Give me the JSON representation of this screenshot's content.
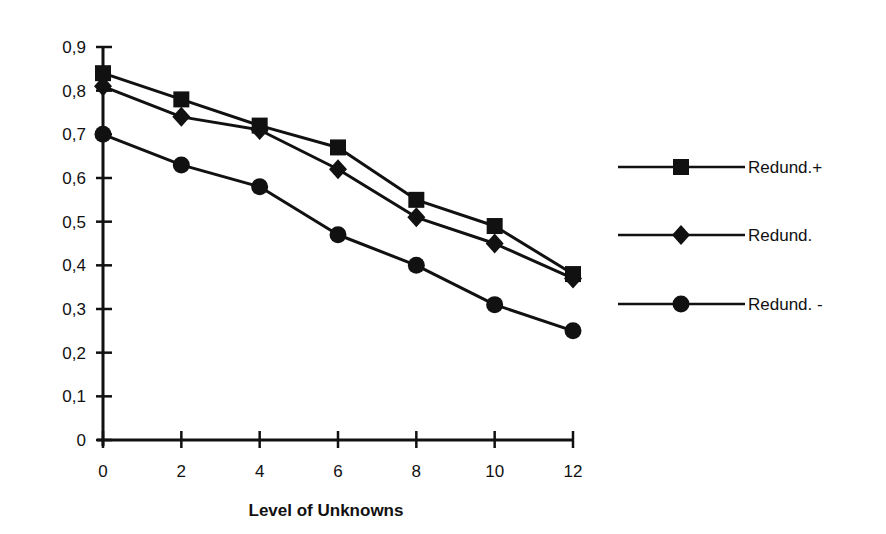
{
  "chart_data": {
    "type": "line",
    "title": "",
    "xlabel": "Level of Unknowns",
    "ylabel": "",
    "x": [
      0,
      2,
      4,
      6,
      8,
      10,
      12
    ],
    "xticks": [
      "0",
      "2",
      "4",
      "6",
      "8",
      "10",
      "12"
    ],
    "yticks": [
      "0",
      "0,1",
      "0,2",
      "0,3",
      "0,4",
      "0,5",
      "0,6",
      "0,7",
      "0,8",
      "0,9"
    ],
    "xlim": [
      0,
      12
    ],
    "ylim": [
      0,
      0.9
    ],
    "grid": false,
    "legend_position": "right",
    "series": [
      {
        "name": "Redund.+",
        "marker": "square",
        "values": [
          0.84,
          0.78,
          0.72,
          0.67,
          0.55,
          0.49,
          0.38
        ]
      },
      {
        "name": "Redund.",
        "marker": "diamond",
        "values": [
          0.81,
          0.74,
          0.71,
          0.62,
          0.51,
          0.45,
          0.37
        ]
      },
      {
        "name": "Redund. -",
        "marker": "circle",
        "values": [
          0.7,
          0.63,
          0.58,
          0.47,
          0.4,
          0.31,
          0.25
        ]
      }
    ],
    "line_color": "#111111"
  }
}
